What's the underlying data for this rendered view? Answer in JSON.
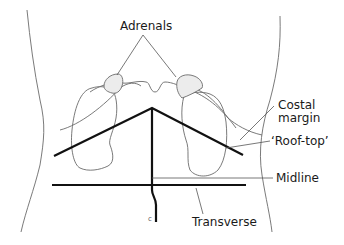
{
  "diagram": {
    "type": "anatomical-line-drawing",
    "labels": {
      "adrenals": "Adrenals",
      "costal_margin_line1": "Costal",
      "costal_margin_line2": "margin",
      "roof_top": "‘Roof-top’",
      "midline": "Midline",
      "transverse": "Transverse"
    },
    "colors": {
      "outline": "#6b6b6b",
      "incision": "#111111",
      "adrenal_fill": "#ececec",
      "background": "#ffffff"
    }
  }
}
